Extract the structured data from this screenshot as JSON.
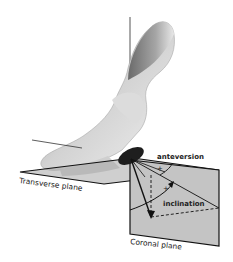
{
  "labels": {
    "anteversion": "anteversion",
    "inclination": "inclination",
    "transverse_plane": "Transverse plane",
    "coronal_plane": "Coronal plane",
    "plus_anteversion": "+",
    "plus_inclination": "+"
  },
  "colors": {
    "bone_light": "#e6e6e6",
    "bone_mid": "#b4b4b4",
    "bone_dark": "#6e6e6e",
    "acetabulum": "#1e1e1e",
    "plane_fill": "#bdbdbd",
    "coronal_fill": "#c8c8c8",
    "line": "#111111"
  }
}
